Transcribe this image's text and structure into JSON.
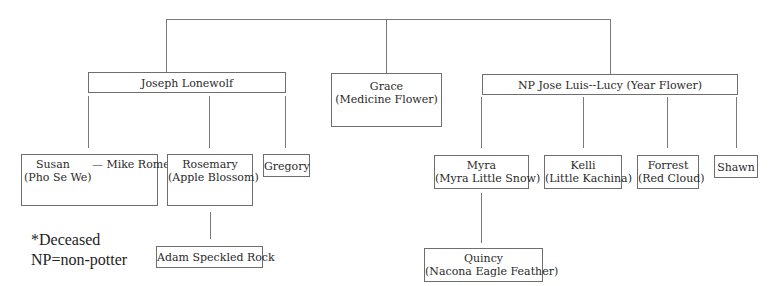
{
  "generation1": {
    "joseph": {
      "name": "Joseph Lonewolf"
    },
    "grace": {
      "name": "Grace",
      "alias": "(Medicine Flower)"
    },
    "jose": {
      "name": "NP Jose Luis--Lucy (Year Flower)"
    }
  },
  "generation2": {
    "susan": {
      "name": "Susan",
      "spouse": "— Mike Romero",
      "alias": "(Pho Se We)"
    },
    "rosemary": {
      "name": "Rosemary",
      "alias": "(Apple Blossom)"
    },
    "gregory": {
      "name": "Gregory"
    },
    "myra": {
      "name": "Myra",
      "alias": "(Myra Little Snow)"
    },
    "kelli": {
      "name": "Kelli",
      "alias": "(Little Kachina)"
    },
    "forrest": {
      "name": "Forrest",
      "alias": "(Red Cloud)"
    },
    "shawn": {
      "name": "Shawn"
    }
  },
  "generation3": {
    "adam": {
      "name": "Adam Speckled Rock"
    },
    "quincy": {
      "name": "Quincy",
      "alias": "(Nacona Eagle Feather)"
    }
  },
  "legend": {
    "deceased": "*Deceased",
    "nonpotter": "NP=non-potter"
  }
}
